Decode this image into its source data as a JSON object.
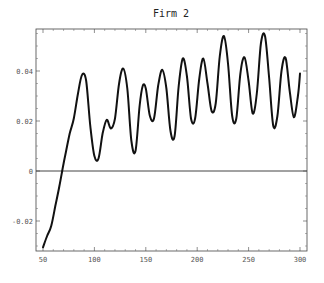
{
  "chart_data": {
    "type": "line",
    "title": "Firm 2",
    "xlabel": "",
    "ylabel": "",
    "xlim": [
      48,
      304
    ],
    "ylim": [
      -0.032,
      0.056
    ],
    "grid": false,
    "legend": null,
    "x_ticks": [
      50,
      100,
      150,
      200,
      250,
      300
    ],
    "x_tick_labels": [
      "50",
      "100",
      "150",
      "200",
      "250",
      "300"
    ],
    "y_ticks": [
      -0.02,
      0,
      0.02,
      0.04
    ],
    "y_tick_labels": [
      "-0.02",
      "0",
      "0.02",
      "0.04"
    ],
    "reference_lines": [
      {
        "axis": "y",
        "value": 0
      }
    ],
    "series": [
      {
        "name": "Firm 2",
        "x": [
          50,
          54,
          58,
          62,
          66,
          70,
          72,
          76,
          80,
          84,
          88,
          92,
          96,
          100,
          104,
          108,
          112,
          116,
          120,
          124,
          128,
          132,
          136,
          140,
          144,
          147,
          150,
          154,
          158,
          162,
          166,
          170,
          174,
          178,
          182,
          186,
          190,
          194,
          198,
          202,
          206,
          210,
          214,
          218,
          222,
          226,
          230,
          234,
          238,
          242,
          246,
          250,
          254,
          258,
          262,
          266,
          270,
          274,
          278,
          282,
          286,
          290,
          294,
          298,
          300
        ],
        "values": [
          -0.0305,
          -0.026,
          -0.022,
          -0.014,
          -0.006,
          0.003,
          0.007,
          0.015,
          0.021,
          0.031,
          0.0385,
          0.036,
          0.018,
          0.006,
          0.005,
          0.015,
          0.0205,
          0.017,
          0.021,
          0.035,
          0.041,
          0.033,
          0.012,
          0.008,
          0.026,
          0.034,
          0.033,
          0.022,
          0.021,
          0.034,
          0.0405,
          0.033,
          0.016,
          0.014,
          0.034,
          0.045,
          0.038,
          0.021,
          0.021,
          0.037,
          0.045,
          0.035,
          0.024,
          0.027,
          0.046,
          0.054,
          0.043,
          0.022,
          0.021,
          0.039,
          0.0455,
          0.036,
          0.023,
          0.031,
          0.051,
          0.054,
          0.037,
          0.018,
          0.022,
          0.04,
          0.0452,
          0.032,
          0.0215,
          0.03,
          0.039
        ]
      }
    ]
  }
}
